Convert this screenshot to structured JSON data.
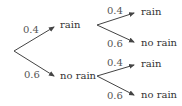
{
  "diagram": {
    "type": "probability-tree",
    "root": {
      "branches": [
        {
          "probability": "0.4",
          "outcome": "rain",
          "branches": [
            {
              "probability": "0.4",
              "outcome": "rain"
            },
            {
              "probability": "0.6",
              "outcome": "no rain"
            }
          ]
        },
        {
          "probability": "0.6",
          "outcome": "no rain",
          "branches": [
            {
              "probability": "0.4",
              "outcome": "rain"
            },
            {
              "probability": "0.6",
              "outcome": "no rain"
            }
          ]
        }
      ]
    },
    "colors": {
      "line": "#444444",
      "text": "#333333"
    }
  }
}
